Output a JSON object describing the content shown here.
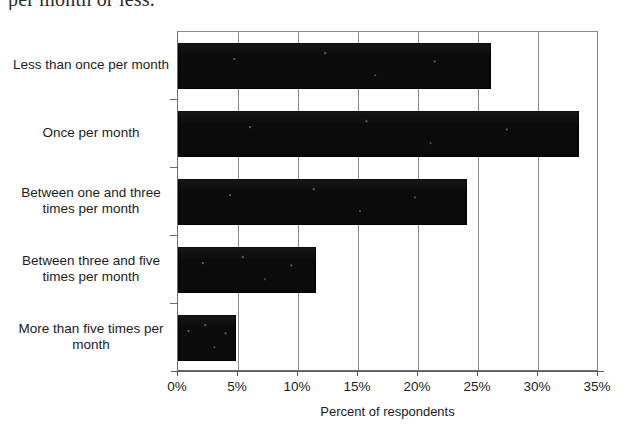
{
  "caption_fragment": "per month or less.",
  "chart_data": {
    "type": "bar",
    "orientation": "horizontal",
    "title": "",
    "subtitle": "",
    "xlabel": "Percent of respondents",
    "ylabel": "",
    "categories": [
      "Less than once per month",
      "Once per month",
      "Between one and three times per month",
      "Between three and five times per month",
      "More than five times per month"
    ],
    "values": [
      26.1,
      33.4,
      24.1,
      11.5,
      4.8
    ],
    "value_unit": "%",
    "xlim": [
      0,
      35
    ],
    "xtick_values": [
      0,
      5,
      10,
      15,
      20,
      25,
      30,
      35
    ],
    "xtick_labels": [
      "0%",
      "5%",
      "10%",
      "15%",
      "20%",
      "25%",
      "30%",
      "35%"
    ],
    "grid": "vertical",
    "legend": "none",
    "bar_color": "#0b0b0b",
    "axis_color": "#6e6e6e",
    "gridline_color": "#8d8d8d",
    "background_color": "#ffffff"
  }
}
